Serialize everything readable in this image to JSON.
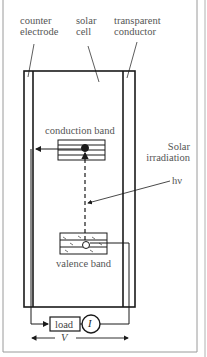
{
  "labels": {
    "counter_electrode": [
      "counter",
      "electrode"
    ],
    "solar_cell": [
      "solar",
      "cell"
    ],
    "transparent_conductor": [
      "transparent",
      "conductor"
    ],
    "conduction_band": "conduction band",
    "valence_band": "valence band",
    "solar_irradiation": [
      "Solar",
      "irradiation"
    ],
    "photon": "hν",
    "load": "load",
    "current": "I",
    "voltage": "V"
  },
  "colors": {
    "line": "#1a1a1a",
    "text": "#555555",
    "frame": "#9a9a9a"
  }
}
